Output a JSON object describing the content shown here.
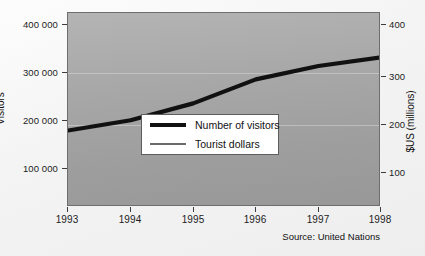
{
  "chart_data": {
    "type": "line",
    "title": "",
    "xlabel": "",
    "ylabel": "Visitors",
    "y2label": "$US (millions)",
    "x": [
      "1993",
      "1994",
      "1995",
      "1996",
      "1997",
      "1998"
    ],
    "xticklabels": [
      "1993",
      "1994",
      "1995",
      "1996",
      "1997",
      "1998"
    ],
    "yticklabels": [
      "400 000",
      "300 000",
      "200 000",
      "100 000"
    ],
    "ytickvalues": [
      400000,
      300000,
      200000,
      100000
    ],
    "ylim": [
      62500,
      441667
    ],
    "y2ticklabels": [
      "400",
      "300",
      "200",
      "100"
    ],
    "y2tickvalues": [
      400,
      300,
      200,
      100
    ],
    "y2lim": [
      62500,
      437500
    ],
    "grid": true,
    "legend_position": "center-right",
    "series": [
      {
        "name": "Number of visitors",
        "axis": "left",
        "color": "#111111",
        "width": 4,
        "values": [
          212000,
          232000,
          265000,
          312000,
          338000,
          355000
        ]
      },
      {
        "name": "Tourist dollars",
        "axis": "right",
        "color": "#6b6b6b",
        "width": 2,
        "values": [
          150,
          195,
          255,
          323,
          370,
          408
        ]
      }
    ],
    "source": "Source: United Nations"
  },
  "legend": {
    "items": [
      {
        "label": "Number of visitors"
      },
      {
        "label": "Tourist dollars"
      }
    ]
  }
}
